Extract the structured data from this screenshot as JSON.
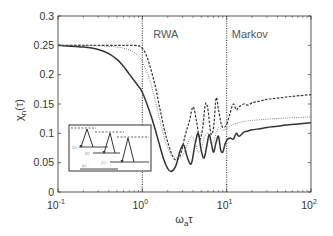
{
  "chart_data": {
    "type": "line",
    "title": "",
    "xlabel": "ω_a τ",
    "ylabel": "χ_n(τ)",
    "xscale": "log",
    "xlim": [
      0.1,
      100
    ],
    "ylim": [
      0,
      0.3
    ],
    "xticks": [
      0.1,
      1,
      10,
      100
    ],
    "xtick_labels": [
      {
        "base": "10",
        "exp": "-1"
      },
      {
        "base": "10",
        "exp": "0"
      },
      {
        "base": "10",
        "exp": "1"
      },
      {
        "base": "10",
        "exp": "2"
      }
    ],
    "yticks": [
      0,
      0.05,
      0.1,
      0.15,
      0.2,
      0.25,
      0.3
    ],
    "ytick_labels": [
      "0",
      "0.05",
      "0.1",
      "0.15",
      "0.2",
      "0.25",
      "0.3"
    ],
    "grid": false,
    "annotations": [
      {
        "text": "RWA",
        "x": 1.35,
        "y": 0.27
      },
      {
        "text": "Markov",
        "x": 11.5,
        "y": 0.27
      }
    ],
    "vlines": [
      {
        "x": 1,
        "style": "dotted"
      },
      {
        "x": 10,
        "style": "dotted"
      }
    ],
    "series": [
      {
        "name": "solid",
        "style": "solid",
        "x": [
          0.1,
          0.2,
          0.3,
          0.4,
          0.5,
          0.6,
          0.7,
          0.8,
          0.9,
          1.0,
          1.2,
          1.4,
          1.6,
          1.8,
          2.0,
          2.2,
          2.5,
          2.8,
          3.1,
          3.4,
          3.8,
          4.2,
          4.6,
          5.0,
          5.4,
          5.8,
          6.2,
          6.6,
          7.0,
          7.5,
          8.0,
          8.5,
          9.0,
          9.5,
          10,
          11,
          12,
          13,
          14,
          16,
          18,
          20,
          25,
          30,
          40,
          50,
          70,
          100
        ],
        "y": [
          0.25,
          0.247,
          0.243,
          0.236,
          0.226,
          0.214,
          0.201,
          0.19,
          0.18,
          0.17,
          0.14,
          0.11,
          0.08,
          0.055,
          0.04,
          0.035,
          0.045,
          0.07,
          0.08,
          0.06,
          0.048,
          0.08,
          0.1,
          0.07,
          0.058,
          0.078,
          0.098,
          0.082,
          0.068,
          0.085,
          0.095,
          0.072,
          0.068,
          0.08,
          0.088,
          0.092,
          0.09,
          0.1,
          0.095,
          0.102,
          0.104,
          0.106,
          0.108,
          0.11,
          0.112,
          0.114,
          0.116,
          0.118
        ]
      },
      {
        "name": "dashed",
        "style": "dashed",
        "x": [
          0.1,
          0.2,
          0.3,
          0.5,
          0.7,
          0.9,
          1.0,
          1.1,
          1.2,
          1.4,
          1.6,
          1.8,
          2.0,
          2.3,
          2.6,
          2.9,
          3.2,
          3.6,
          4.0,
          4.4,
          4.8,
          5.2,
          5.6,
          6.0,
          6.5,
          7.0,
          7.5,
          8.0,
          8.5,
          9.0,
          10,
          11,
          12,
          13,
          14,
          16,
          18,
          20,
          25,
          30,
          40,
          60,
          100
        ],
        "y": [
          0.25,
          0.25,
          0.25,
          0.25,
          0.25,
          0.249,
          0.245,
          0.235,
          0.22,
          0.185,
          0.145,
          0.11,
          0.085,
          0.06,
          0.055,
          0.068,
          0.095,
          0.12,
          0.145,
          0.12,
          0.09,
          0.11,
          0.15,
          0.14,
          0.1,
          0.11,
          0.16,
          0.14,
          0.12,
          0.11,
          0.115,
          0.135,
          0.15,
          0.14,
          0.145,
          0.15,
          0.148,
          0.152,
          0.155,
          0.158,
          0.16,
          0.163,
          0.166
        ]
      },
      {
        "name": "dotted",
        "style": "dotted",
        "x": [
          0.1,
          0.2,
          0.3,
          0.5,
          0.7,
          0.9,
          1.0,
          1.2,
          1.4,
          1.6,
          1.8,
          2.0,
          2.3,
          2.6,
          3.0,
          3.4,
          3.8,
          4.2,
          4.6,
          5.0,
          5.5,
          6.0,
          6.5,
          7.0,
          7.5,
          8.0,
          9.0,
          10,
          12,
          14,
          16,
          20,
          30,
          50,
          100
        ],
        "y": [
          0.25,
          0.25,
          0.249,
          0.247,
          0.242,
          0.232,
          0.222,
          0.195,
          0.16,
          0.125,
          0.095,
          0.075,
          0.06,
          0.058,
          0.062,
          0.08,
          0.095,
          0.085,
          0.068,
          0.075,
          0.095,
          0.1,
          0.085,
          0.085,
          0.1,
          0.11,
          0.105,
          0.108,
          0.115,
          0.118,
          0.12,
          0.122,
          0.124,
          0.126,
          0.128
        ]
      }
    ],
    "inset": {
      "description": "Energy level diagram with three excitation/relaxation triangles",
      "labels": [
        "|3⟩",
        "|2⟩",
        "|1⟩",
        "|a⟩"
      ]
    }
  },
  "axes": {
    "ylabel_main": "χ",
    "ylabel_sub": "n",
    "ylabel_tail": "(τ)",
    "xlabel_main": "ω",
    "xlabel_sub": "a",
    "xlabel_tail": "τ"
  }
}
